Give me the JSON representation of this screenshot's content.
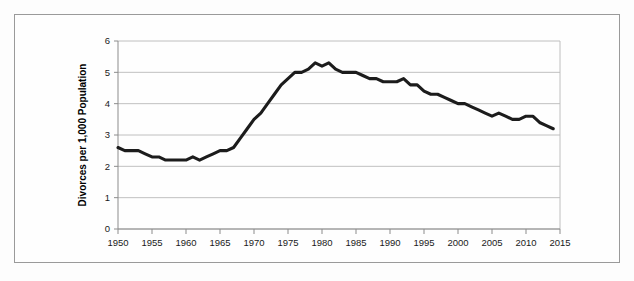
{
  "chart_data": {
    "type": "line",
    "title": "",
    "xlabel": "",
    "ylabel": "Divorces per 1,000 Population",
    "xlim": [
      1950,
      2015
    ],
    "ylim": [
      0,
      6
    ],
    "grid": true,
    "legend": null,
    "xticks": [
      1950,
      1955,
      1960,
      1965,
      1970,
      1975,
      1980,
      1985,
      1990,
      1995,
      2000,
      2005,
      2010,
      2015
    ],
    "xtick_labels": [
      "1950",
      "1955",
      "1960",
      "1965",
      "1970",
      "1975",
      "1980",
      "1985",
      "1990",
      "1995",
      "2000",
      "2005",
      "2010",
      "2015"
    ],
    "yticks": [
      0,
      1,
      2,
      3,
      4,
      5,
      6
    ],
    "ytick_labels": [
      "0",
      "1",
      "2",
      "3",
      "4",
      "5",
      "6"
    ],
    "series": [
      {
        "name": "Divorce rate",
        "color": "#1c1c1c",
        "x": [
          1950,
          1951,
          1952,
          1953,
          1954,
          1955,
          1956,
          1957,
          1958,
          1959,
          1960,
          1961,
          1962,
          1963,
          1964,
          1965,
          1966,
          1967,
          1968,
          1969,
          1970,
          1971,
          1972,
          1973,
          1974,
          1975,
          1976,
          1977,
          1978,
          1979,
          1980,
          1981,
          1982,
          1983,
          1984,
          1985,
          1986,
          1987,
          1988,
          1989,
          1990,
          1991,
          1992,
          1993,
          1994,
          1995,
          1996,
          1997,
          1998,
          1999,
          2000,
          2001,
          2002,
          2003,
          2004,
          2005,
          2006,
          2007,
          2008,
          2009,
          2010,
          2011,
          2012,
          2013,
          2014
        ],
        "values": [
          2.6,
          2.5,
          2.5,
          2.5,
          2.4,
          2.3,
          2.3,
          2.2,
          2.2,
          2.2,
          2.2,
          2.3,
          2.2,
          2.3,
          2.4,
          2.5,
          2.5,
          2.6,
          2.9,
          3.2,
          3.5,
          3.7,
          4.0,
          4.3,
          4.6,
          4.8,
          5.0,
          5.0,
          5.1,
          5.3,
          5.2,
          5.3,
          5.1,
          5.0,
          5.0,
          5.0,
          4.9,
          4.8,
          4.8,
          4.7,
          4.7,
          4.7,
          4.8,
          4.6,
          4.6,
          4.4,
          4.3,
          4.3,
          4.2,
          4.1,
          4.0,
          4.0,
          3.9,
          3.8,
          3.7,
          3.6,
          3.7,
          3.6,
          3.5,
          3.5,
          3.6,
          3.6,
          3.4,
          3.3,
          3.2
        ]
      }
    ]
  },
  "axes": {
    "y_title": "Divorces per 1,000 Population"
  }
}
